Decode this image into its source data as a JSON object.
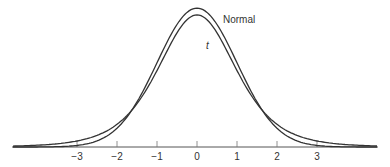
{
  "chart_data": {
    "type": "line",
    "title": "",
    "xlabel": "",
    "ylabel": "",
    "x_ticks": [
      -3,
      -2,
      -1,
      0,
      1,
      2,
      3
    ],
    "x_tick_labels": [
      "−3",
      "−2",
      "−1",
      "0",
      "1",
      "2",
      "3"
    ],
    "xlim": [
      -4.6,
      4.5
    ],
    "grid": false,
    "series": [
      {
        "name": "Normal",
        "label": "Normal",
        "peak": 0.399,
        "df": null
      },
      {
        "name": "t",
        "label": "t",
        "peak": 0.38,
        "df": 5
      }
    ],
    "annotations": [
      {
        "text": "Normal",
        "x": 0.8,
        "y": 0.37
      },
      {
        "text": "t",
        "x": 0.05,
        "y": 0.26
      }
    ],
    "line_color": "#333333"
  }
}
